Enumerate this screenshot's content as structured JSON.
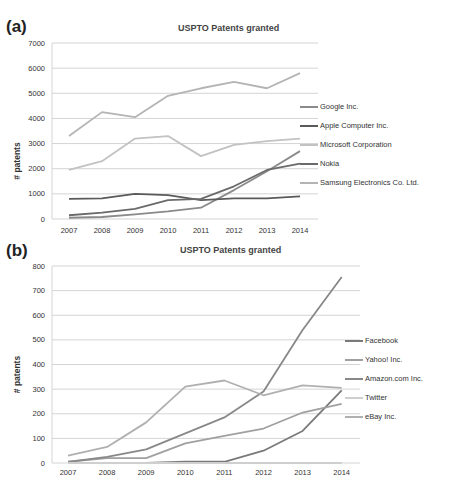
{
  "chart_data": [
    {
      "panel": "(a)",
      "type": "line",
      "title": "USPTO Patents granted",
      "xlabel": "",
      "ylabel": "# patents",
      "x": [
        "2007",
        "2008",
        "2009",
        "2010",
        "2011",
        "2012",
        "2013",
        "2014"
      ],
      "ylim": [
        0,
        7000
      ],
      "yticks": [
        "0",
        "1000",
        "2000",
        "3000",
        "4000",
        "5000",
        "6000",
        "7000"
      ],
      "grid": true,
      "legend_position": "right",
      "series": [
        {
          "name": "Google Inc.",
          "color": "#8a8a8a",
          "values": [
            50,
            80,
            180,
            300,
            450,
            1150,
            1900,
            2700
          ]
        },
        {
          "name": "Apple Computer Inc.",
          "color": "#5a5a5a",
          "values": [
            800,
            820,
            1000,
            950,
            750,
            820,
            820,
            900
          ]
        },
        {
          "name": "Microsoft Corporation",
          "color": "#c2c2c2",
          "values": [
            1950,
            2300,
            3200,
            3300,
            2500,
            2950,
            3100,
            3200
          ]
        },
        {
          "name": "Nokia",
          "color": "#6a6a6a",
          "values": [
            150,
            250,
            400,
            750,
            800,
            1300,
            1950,
            2200
          ]
        },
        {
          "name": "Samsung Electronics Co. Ltd.",
          "color": "#b4b4b4",
          "values": [
            3300,
            4250,
            4050,
            4900,
            5200,
            5450,
            5200,
            5800
          ]
        }
      ]
    },
    {
      "panel": "(b)",
      "type": "line",
      "title": "USPTO Patents granted",
      "xlabel": "",
      "ylabel": "# patents",
      "x": [
        "2007",
        "2008",
        "2009",
        "2010",
        "2011",
        "2012",
        "2013",
        "2014"
      ],
      "ylim": [
        0,
        800
      ],
      "yticks": [
        "0",
        "100",
        "200",
        "300",
        "400",
        "500",
        "600",
        "700",
        "800"
      ],
      "grid": true,
      "legend_position": "right",
      "series": [
        {
          "name": "Facebook",
          "color": "#7a7a7a",
          "values": [
            0,
            0,
            0,
            5,
            5,
            50,
            130,
            295
          ]
        },
        {
          "name": "Yahoo! Inc.",
          "color": "#a0a0a0",
          "values": [
            5,
            20,
            20,
            80,
            110,
            140,
            205,
            240
          ]
        },
        {
          "name": "Amazon.com Inc.",
          "color": "#888888",
          "values": [
            5,
            25,
            55,
            120,
            185,
            290,
            540,
            755
          ]
        },
        {
          "name": "Twitter",
          "color": "#cfcfcf",
          "values": [
            0,
            0,
            0,
            0,
            0,
            0,
            0,
            0
          ]
        },
        {
          "name": "eBay Inc.",
          "color": "#b0b0b0",
          "values": [
            30,
            65,
            165,
            310,
            335,
            275,
            315,
            305
          ]
        }
      ]
    }
  ]
}
